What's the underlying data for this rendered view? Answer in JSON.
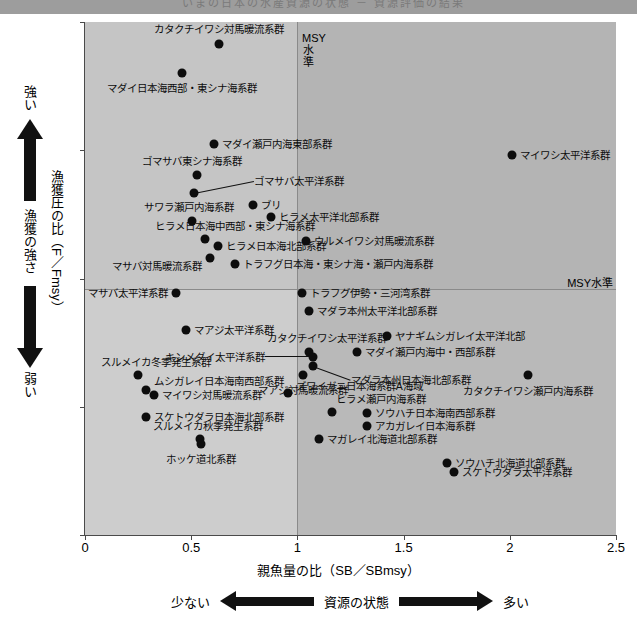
{
  "topbar": {
    "text": "いまの日本の水産資源の状態 － 資源評価の結果"
  },
  "axes": {
    "y_label": "漁獲圧の比（F／Fmsy）",
    "x_label": "親魚量の比（SB／SBmsy）",
    "y_ticks": [
      "0",
      "0.5",
      "1",
      "1.5",
      "2"
    ],
    "x_ticks": [
      "0",
      "0.5",
      "1",
      "1.5",
      "2",
      "2.5"
    ],
    "msy_vertical_label": "MSY水準",
    "msy_horizontal_label": "MSY水準"
  },
  "annotations": {
    "fishing_strength_title": "漁獲の強さ",
    "fishing_strength_high": "強い",
    "fishing_strength_low": "弱い",
    "stock_state_title": "資源の状態",
    "stock_state_low": "少ない",
    "stock_state_high": "多い"
  },
  "chart_data": {
    "type": "scatter",
    "title": "いまの日本の水産資源の状態 － 資源評価の結果",
    "xlabel": "親魚量の比（SB／SBmsy）",
    "ylabel": "漁獲圧の比（F／Fmsy）",
    "xlim": [
      0,
      2.5
    ],
    "ylim": [
      0,
      2
    ],
    "grid": false,
    "reference_lines": {
      "x": 1.0,
      "y": 1.0,
      "label": "MSY水準"
    },
    "points": [
      {
        "label": "カタクチイワシ対馬暖流系群",
        "x": 0.63,
        "y": 1.915,
        "lpos": "c",
        "ldx": 0,
        "ldy": -15
      },
      {
        "label": "マダイ日本海西部・東シナ海系群",
        "x": 0.455,
        "y": 1.8,
        "lpos": "c",
        "ldx": 0,
        "ldy": 15
      },
      {
        "label": "マダイ瀬戸内海東部系群",
        "x": 0.605,
        "y": 1.525,
        "lpos": "r",
        "ldx": 8,
        "ldy": 0
      },
      {
        "label": "ゴマサバ東シナ海系群",
        "x": 0.525,
        "y": 1.405,
        "lpos": "c",
        "ldx": -5,
        "ldy": -14
      },
      {
        "label": "ゴマサバ太平洋系群",
        "x": 0.515,
        "y": 1.335,
        "lpos": "r",
        "ldx": 60,
        "ldy": -12,
        "leader": true
      },
      {
        "label": "ブリ",
        "x": 0.79,
        "y": 1.285,
        "lpos": "r",
        "ldx": 8,
        "ldy": 0
      },
      {
        "label": "サワラ瀬戸内海系群",
        "x": 0.505,
        "y": 1.225,
        "lpos": "c",
        "ldx": -3,
        "ldy": -14
      },
      {
        "label": "ヒラメ太平洋北部系群",
        "x": 0.875,
        "y": 1.24,
        "lpos": "r",
        "ldx": 8,
        "ldy": 0
      },
      {
        "label": "ヒラメ日本海中西部・東シナ海系群",
        "x": 0.565,
        "y": 1.155,
        "lpos": "c",
        "ldx": 30,
        "ldy": -13
      },
      {
        "label": "ヒラメ日本海北部系群",
        "x": 0.625,
        "y": 1.125,
        "lpos": "r",
        "ldx": 8,
        "ldy": 0
      },
      {
        "label": "ウルメイワシ対馬暖流系群",
        "x": 1.04,
        "y": 1.145,
        "lpos": "r",
        "ldx": 8,
        "ldy": 0
      },
      {
        "label": "マサバ対馬暖流系群",
        "x": 0.59,
        "y": 1.08,
        "lpos": "l",
        "ldx": -8,
        "ldy": 8
      },
      {
        "label": "トラフグ日本海・東シナ海・瀬戸内海系群",
        "x": 0.705,
        "y": 1.055,
        "lpos": "r",
        "ldx": 8,
        "ldy": 0
      },
      {
        "label": "トラフグ伊勢・三河湾系群",
        "x": 1.02,
        "y": 0.945,
        "lpos": "r",
        "ldx": 8,
        "ldy": 0
      },
      {
        "label": "マサバ太平洋系群",
        "x": 0.43,
        "y": 0.945,
        "lpos": "l",
        "ldx": -8,
        "ldy": 0
      },
      {
        "label": "マダラ本州太平洋北部系群",
        "x": 1.055,
        "y": 0.875,
        "lpos": "r",
        "ldx": 8,
        "ldy": 0
      },
      {
        "label": "マアジ太平洋系群",
        "x": 0.475,
        "y": 0.8,
        "lpos": "r",
        "ldx": 8,
        "ldy": 0
      },
      {
        "label": "カタクチイワシ太平洋系群",
        "x": 1.055,
        "y": 0.715,
        "lpos": "c",
        "ldx": 18,
        "ldy": -14
      },
      {
        "label": "ヤナギムシガレイ太平洋北部",
        "x": 1.42,
        "y": 0.775,
        "lpos": "r",
        "ldx": 8,
        "ldy": 0
      },
      {
        "label": "キンメダイ太平洋系群",
        "x": 1.075,
        "y": 0.695,
        "lpos": "l",
        "ldx": -48,
        "ldy": 0,
        "leader": true
      },
      {
        "label": "マダイ瀬戸内海中・西部系群",
        "x": 1.28,
        "y": 0.715,
        "lpos": "r",
        "ldx": 8,
        "ldy": 0
      },
      {
        "label": "マダラ本州日本海北部系群",
        "x": 1.075,
        "y": 0.66,
        "lpos": "r",
        "ldx": 38,
        "ldy": 14,
        "leader": true
      },
      {
        "label": "スルメイカ冬季発生系群",
        "x": 0.25,
        "y": 0.625,
        "lpos": "c",
        "ldx": 18,
        "ldy": -13
      },
      {
        "label": "マアジ対馬暖流系群",
        "x": 1.025,
        "y": 0.625,
        "lpos": "c",
        "ldx": 0,
        "ldy": 15
      },
      {
        "label": "カタクチイワシ瀬戸内海系群",
        "x": 2.085,
        "y": 0.625,
        "lpos": "c",
        "ldx": 0,
        "ldy": 16
      },
      {
        "label": "ムシガレイ日本海南西部系群",
        "x": 0.285,
        "y": 0.565,
        "lpos": "r",
        "ldx": 8,
        "ldy": -9
      },
      {
        "label": "ズワイガニ日本海系群A海域",
        "x": 0.955,
        "y": 0.555,
        "lpos": "r",
        "ldx": 8,
        "ldy": -7
      },
      {
        "label": "マイワシ対馬暖流系群",
        "x": 0.325,
        "y": 0.545,
        "lpos": "r",
        "ldx": 8,
        "ldy": 0
      },
      {
        "label": "ヒラメ瀬戸内海系群",
        "x": 1.165,
        "y": 0.48,
        "lpos": "r",
        "ldx": 4,
        "ldy": -13
      },
      {
        "label": "ソウハチ日本海南西部系群",
        "x": 1.33,
        "y": 0.475,
        "lpos": "r",
        "ldx": 8,
        "ldy": 0
      },
      {
        "label": "スケトウダラ日本海北部系群",
        "x": 0.285,
        "y": 0.46,
        "lpos": "r",
        "ldx": 8,
        "ldy": 0
      },
      {
        "label": "アカガレイ日本海系群",
        "x": 1.33,
        "y": 0.425,
        "lpos": "r",
        "ldx": 8,
        "ldy": 0
      },
      {
        "label": "スルメイカ秋季発生系群",
        "x": 0.54,
        "y": 0.375,
        "lpos": "c",
        "ldx": 8,
        "ldy": -13
      },
      {
        "label": "マガレイ北海道北部系群",
        "x": 1.1,
        "y": 0.375,
        "lpos": "r",
        "ldx": 8,
        "ldy": 0
      },
      {
        "label": "ホッケ道北系群",
        "x": 0.545,
        "y": 0.355,
        "lpos": "c",
        "ldx": 0,
        "ldy": 15
      },
      {
        "label": "ソウハチ北海道北部系群",
        "x": 1.705,
        "y": 0.28,
        "lpos": "r",
        "ldx": 8,
        "ldy": 0
      },
      {
        "label": "スケトウダラ太平洋系群",
        "x": 1.735,
        "y": 0.245,
        "lpos": "r",
        "ldx": 8,
        "ldy": 0
      },
      {
        "label": "マイワシ太平洋系群",
        "x": 2.01,
        "y": 1.48,
        "lpos": "r",
        "ldx": 8,
        "ldy": 0
      }
    ]
  }
}
